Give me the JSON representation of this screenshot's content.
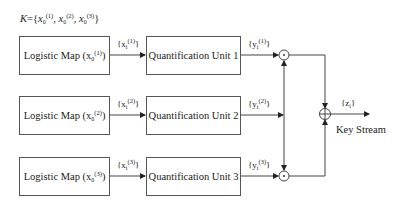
{
  "key_label": {
    "prefix": "K={x",
    "parts": [
      {
        "sub": "0",
        "sup": "(1)"
      },
      {
        "sub": "0",
        "sup": "(2)"
      },
      {
        "sub": "0",
        "sup": "(3)"
      }
    ]
  },
  "rows": [
    {
      "logistic_label": "Logistic Map (x",
      "logistic_sub": "0",
      "logistic_sup": "(1)",
      "x_label": "{x",
      "x_sub": "i",
      "x_sup": "(1)",
      "quant_label": "Quantification Unit 1",
      "y_label": "{y",
      "y_sub": "i",
      "y_sup": "(1)"
    },
    {
      "logistic_label": "Logistic Map (x",
      "logistic_sub": "0",
      "logistic_sup": "(2)",
      "x_label": "{x",
      "x_sub": "i",
      "x_sup": "(2)",
      "quant_label": "Quantification Unit 2",
      "y_label": "{y",
      "y_sub": "i",
      "y_sup": "(2)"
    },
    {
      "logistic_label": "Logistic Map (x",
      "logistic_sub": "0",
      "logistic_sup": "(3)",
      "x_label": "{x",
      "x_sub": "i",
      "x_sup": "(3)",
      "quant_label": "Quantification Unit 3",
      "y_label": "{y",
      "y_sub": "i",
      "y_sup": "(3)"
    }
  ],
  "output": {
    "z_label": "{z",
    "z_sub": "i",
    "z_close": "}",
    "key_stream": "Key Stream"
  },
  "close_brace": "}",
  "close_paren": ")",
  "comma": ", "
}
